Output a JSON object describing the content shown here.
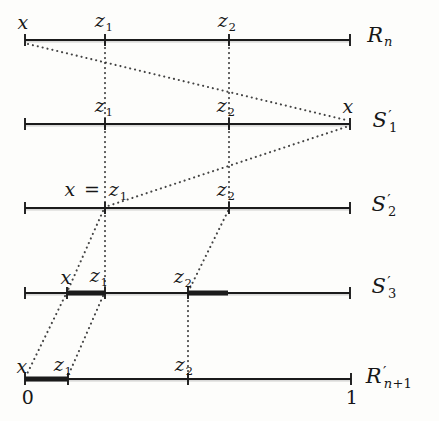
{
  "figure": {
    "width": 439,
    "height": 421,
    "background": "#fdfdfb",
    "ink": "#1b1b1b",
    "dot_color": "#2b2b2b"
  },
  "diagram": {
    "rows": [
      {
        "id": "Rn",
        "row_label": {
          "text": "R_n",
          "x": 380,
          "y": 37
        },
        "line": {
          "y": 40,
          "x1": 25,
          "x2": 350
        },
        "ticks": [
          25,
          105,
          229,
          350
        ],
        "thick_segments": [],
        "point_labels": [
          {
            "text": "x",
            "x": 23,
            "y": 22
          },
          {
            "text": "z_1",
            "x": 104,
            "y": 22
          },
          {
            "text": "z_2",
            "x": 227,
            "y": 22
          }
        ]
      },
      {
        "id": "S1",
        "row_label": {
          "text": "S'_1",
          "x": 385,
          "y": 121
        },
        "line": {
          "y": 124,
          "x1": 25,
          "x2": 350
        },
        "ticks": [
          25,
          105,
          229,
          350
        ],
        "thick_segments": [],
        "point_labels": [
          {
            "text": "z_1",
            "x": 104,
            "y": 107
          },
          {
            "text": "z_2",
            "x": 226,
            "y": 107
          },
          {
            "text": "x",
            "x": 348,
            "y": 106
          }
        ]
      },
      {
        "id": "S2",
        "row_label": {
          "text": "S'_2",
          "x": 384,
          "y": 205
        },
        "line": {
          "y": 208,
          "x1": 25,
          "x2": 350
        },
        "ticks": [
          25,
          105,
          229,
          350
        ],
        "thick_segments": [],
        "point_labels": [
          {
            "text": "x = z_1",
            "x": 96,
            "y": 191
          },
          {
            "text": "z_2",
            "x": 226,
            "y": 191
          }
        ]
      },
      {
        "id": "S3",
        "row_label": {
          "text": "S'_3",
          "x": 384,
          "y": 287
        },
        "line": {
          "y": 293,
          "x1": 25,
          "x2": 350
        },
        "ticks": [
          25,
          67,
          105,
          188,
          350
        ],
        "thick_segments": [
          [
            67,
            105
          ],
          [
            188,
            228
          ]
        ],
        "point_labels": [
          {
            "text": "x",
            "x": 66,
            "y": 277
          },
          {
            "text": "z_1",
            "x": 99,
            "y": 277
          },
          {
            "text": "z_2",
            "x": 183,
            "y": 278
          }
        ]
      },
      {
        "id": "Rn1",
        "row_label": {
          "text": "R'_{n+1}",
          "x": 389,
          "y": 377
        },
        "line": {
          "y": 379,
          "x1": 25,
          "x2": 351
        },
        "ticks": [
          25,
          68,
          188,
          351
        ],
        "thick_segments": [
          [
            25,
            68
          ]
        ],
        "point_labels": [
          {
            "text": "x",
            "x": 22,
            "y": 366
          },
          {
            "text": "z_1",
            "x": 63,
            "y": 366
          },
          {
            "text": "z_2",
            "x": 184,
            "y": 366
          },
          {
            "text": "0",
            "x": 28,
            "y": 397
          },
          {
            "text": "1",
            "x": 352,
            "y": 397
          }
        ]
      }
    ],
    "connectors": [
      {
        "name": "x-Rn-to-S1",
        "from": [
          28,
          44
        ],
        "to": [
          346,
          120
        ]
      },
      {
        "name": "z1-Rn-to-S1",
        "from": [
          105,
          43
        ],
        "to": [
          105,
          121
        ]
      },
      {
        "name": "z2-Rn-to-S1",
        "from": [
          229,
          43
        ],
        "to": [
          229,
          121
        ]
      },
      {
        "name": "x-S1-to-S2",
        "from": [
          346,
          127
        ],
        "to": [
          108,
          206
        ]
      },
      {
        "name": "z1-S1-to-S2",
        "from": [
          105,
          127
        ],
        "to": [
          105,
          205
        ]
      },
      {
        "name": "z2-S1-to-S2",
        "from": [
          229,
          127
        ],
        "to": [
          229,
          205
        ]
      },
      {
        "name": "x-S2-to-S3",
        "from": [
          103,
          211
        ],
        "to": [
          68,
          290
        ]
      },
      {
        "name": "z1-S2-to-S3",
        "from": [
          105,
          211
        ],
        "to": [
          105,
          290
        ]
      },
      {
        "name": "z2-S2-to-S3",
        "from": [
          228,
          211
        ],
        "to": [
          189,
          290
        ]
      },
      {
        "name": "x-S3-to-Rn1",
        "from": [
          65,
          296
        ],
        "to": [
          26,
          376
        ]
      },
      {
        "name": "z1-S3-to-Rn1",
        "from": [
          103,
          296
        ],
        "to": [
          68,
          376
        ]
      },
      {
        "name": "z2-S3-to-Rn1",
        "from": [
          188,
          296
        ],
        "to": [
          188,
          376
        ]
      }
    ]
  }
}
